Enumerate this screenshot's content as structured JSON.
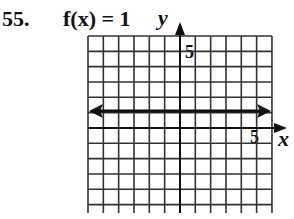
{
  "problem": {
    "number": "55.",
    "function_label": "f(x) = 1"
  },
  "axes": {
    "x_label": "x",
    "y_label": "y",
    "x_tick_label": "5",
    "y_tick_label": "5"
  },
  "graph": {
    "grid_columns": 12,
    "grid_rows": 12,
    "x_range": [
      -6,
      6
    ],
    "y_range": [
      -6,
      6
    ],
    "line": {
      "equation": "y = 1",
      "type": "horizontal",
      "arrows": "both"
    }
  },
  "chart_data": {
    "type": "line",
    "title": "f(x) = 1",
    "xlabel": "x",
    "ylabel": "y",
    "x": [
      -6,
      6
    ],
    "series": [
      {
        "name": "f(x) = 1",
        "values": [
          1,
          1
        ]
      }
    ],
    "xlim": [
      -6,
      6
    ],
    "ylim": [
      -6,
      6
    ],
    "tick_labels": {
      "x": [
        "5"
      ],
      "y": [
        "5"
      ]
    },
    "grid": true
  }
}
